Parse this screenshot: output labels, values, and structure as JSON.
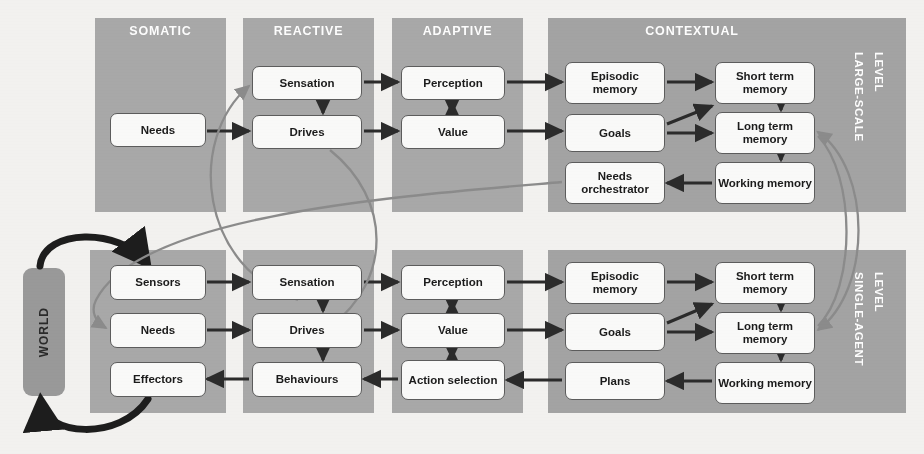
{
  "diagram": {
    "world_label": "WORLD",
    "colors": {
      "panel_gray": "#a9a9a9",
      "node_fill": "#fbfbfa",
      "node_stroke": "#5d5d5d",
      "arrow_dark": "#2b2b2b",
      "arrow_gray": "#8c8c8c",
      "title_text": "#ffffff",
      "background": "#f4f3f1"
    },
    "levels": [
      {
        "id": "large-scale",
        "label": "LARGE-SCALE\nLEVEL",
        "line1": "LARGE-SCALE",
        "line2": "LEVEL"
      },
      {
        "id": "single-agent",
        "label": "SINGLE-AGENT\nLEVEL",
        "line1": "SINGLE-AGENT",
        "line2": "LEVEL"
      }
    ],
    "columns": [
      {
        "id": "somatic",
        "title": "SOMATIC"
      },
      {
        "id": "reactive",
        "title": "REACTIVE"
      },
      {
        "id": "adaptive",
        "title": "ADAPTIVE"
      },
      {
        "id": "contextual",
        "title": "CONTEXTUAL"
      }
    ],
    "top_level_nodes": {
      "somatic": [
        "Needs"
      ],
      "reactive": [
        "Sensation",
        "Drives"
      ],
      "adaptive": [
        "Perception",
        "Value"
      ],
      "contextual_left": [
        "Episodic memory",
        "Goals",
        "Needs orchestrator"
      ],
      "contextual_right": [
        "Short term memory",
        "Long term memory",
        "Working memory"
      ]
    },
    "bottom_level_nodes": {
      "somatic": [
        "Sensors",
        "Needs",
        "Effectors"
      ],
      "reactive": [
        "Sensation",
        "Drives",
        "Behaviours"
      ],
      "adaptive": [
        "Perception",
        "Value",
        "Action selection"
      ],
      "contextual_left": [
        "Episodic memory",
        "Goals",
        "Plans"
      ],
      "contextual_right": [
        "Short term memory",
        "Long term memory",
        "Working memory"
      ]
    },
    "nodes": [
      {
        "id": "t-needs",
        "text": "Needs",
        "x": 110,
        "y": 113,
        "w": 96,
        "h": 34,
        "level": "top"
      },
      {
        "id": "t-sensation",
        "text": "Sensation",
        "x": 252,
        "y": 66,
        "w": 110,
        "h": 34,
        "level": "top"
      },
      {
        "id": "t-drives",
        "text": "Drives",
        "x": 252,
        "y": 115,
        "w": 110,
        "h": 34,
        "level": "top"
      },
      {
        "id": "t-perception",
        "text": "Perception",
        "x": 401,
        "y": 66,
        "w": 104,
        "h": 34,
        "level": "top"
      },
      {
        "id": "t-value",
        "text": "Value",
        "x": 401,
        "y": 115,
        "w": 104,
        "h": 34,
        "level": "top"
      },
      {
        "id": "t-episodic",
        "text": "Episodic memory",
        "x": 565,
        "y": 62,
        "w": 100,
        "h": 42,
        "level": "top"
      },
      {
        "id": "t-goals",
        "text": "Goals",
        "x": 565,
        "y": 114,
        "w": 100,
        "h": 38,
        "level": "top"
      },
      {
        "id": "t-needsorch",
        "text": "Needs orchestrator",
        "x": 565,
        "y": 162,
        "w": 100,
        "h": 42,
        "level": "top"
      },
      {
        "id": "t-short",
        "text": "Short term memory",
        "x": 715,
        "y": 62,
        "w": 100,
        "h": 42,
        "level": "top"
      },
      {
        "id": "t-long",
        "text": "Long term memory",
        "x": 715,
        "y": 112,
        "w": 100,
        "h": 42,
        "level": "top"
      },
      {
        "id": "t-working",
        "text": "Working memory",
        "x": 715,
        "y": 162,
        "w": 100,
        "h": 42,
        "level": "top"
      },
      {
        "id": "b-sensors",
        "text": "Sensors",
        "x": 110,
        "y": 265,
        "w": 96,
        "h": 35,
        "level": "bottom"
      },
      {
        "id": "b-needs",
        "text": "Needs",
        "x": 110,
        "y": 313,
        "w": 96,
        "h": 35,
        "level": "bottom"
      },
      {
        "id": "b-effectors",
        "text": "Effectors",
        "x": 110,
        "y": 362,
        "w": 96,
        "h": 35,
        "level": "bottom"
      },
      {
        "id": "b-sensation",
        "text": "Sensation",
        "x": 252,
        "y": 265,
        "w": 110,
        "h": 35,
        "level": "bottom"
      },
      {
        "id": "b-drives",
        "text": "Drives",
        "x": 252,
        "y": 313,
        "w": 110,
        "h": 35,
        "level": "bottom"
      },
      {
        "id": "b-behaviours",
        "text": "Behaviours",
        "x": 252,
        "y": 362,
        "w": 110,
        "h": 35,
        "level": "bottom"
      },
      {
        "id": "b-perception",
        "text": "Perception",
        "x": 401,
        "y": 265,
        "w": 104,
        "h": 35,
        "level": "bottom"
      },
      {
        "id": "b-value",
        "text": "Value",
        "x": 401,
        "y": 313,
        "w": 104,
        "h": 35,
        "level": "bottom"
      },
      {
        "id": "b-action",
        "text": "Action selection",
        "x": 401,
        "y": 360,
        "w": 104,
        "h": 40,
        "level": "bottom"
      },
      {
        "id": "b-episodic",
        "text": "Episodic memory",
        "x": 565,
        "y": 262,
        "w": 100,
        "h": 42,
        "level": "bottom"
      },
      {
        "id": "b-goals",
        "text": "Goals",
        "x": 565,
        "y": 313,
        "w": 100,
        "h": 38,
        "level": "bottom"
      },
      {
        "id": "b-plans",
        "text": "Plans",
        "x": 565,
        "y": 362,
        "w": 100,
        "h": 38,
        "level": "bottom"
      },
      {
        "id": "b-short",
        "text": "Short term memory",
        "x": 715,
        "y": 262,
        "w": 100,
        "h": 42,
        "level": "bottom"
      },
      {
        "id": "b-long",
        "text": "Long term memory",
        "x": 715,
        "y": 312,
        "w": 100,
        "h": 42,
        "level": "bottom"
      },
      {
        "id": "b-working",
        "text": "Working memory",
        "x": 715,
        "y": 362,
        "w": 100,
        "h": 42,
        "level": "bottom"
      }
    ],
    "edges": [
      {
        "from": "t-needs",
        "to": "t-drives",
        "style": "dark"
      },
      {
        "from": "t-sensation",
        "to": "t-drives",
        "style": "dark"
      },
      {
        "from": "t-sensation",
        "to": "t-perception",
        "style": "dark"
      },
      {
        "from": "t-drives",
        "to": "t-value",
        "style": "dark"
      },
      {
        "from": "t-perception",
        "to": "t-value",
        "style": "dark-bidirectional"
      },
      {
        "from": "t-perception",
        "to": "t-episodic",
        "style": "dark"
      },
      {
        "from": "t-value",
        "to": "t-goals",
        "style": "dark"
      },
      {
        "from": "t-episodic",
        "to": "t-short",
        "style": "dark"
      },
      {
        "from": "t-goals",
        "to": "t-short",
        "style": "dark"
      },
      {
        "from": "t-goals",
        "to": "t-long",
        "style": "dark"
      },
      {
        "from": "t-short",
        "to": "t-long",
        "style": "dark"
      },
      {
        "from": "t-long",
        "to": "t-working",
        "style": "dark"
      },
      {
        "from": "t-working",
        "to": "t-needsorch",
        "style": "dark"
      },
      {
        "from": "b-sensors",
        "to": "b-sensation",
        "style": "dark"
      },
      {
        "from": "b-needs",
        "to": "b-drives",
        "style": "dark"
      },
      {
        "from": "b-behaviours",
        "to": "b-effectors",
        "style": "dark"
      },
      {
        "from": "b-sensation",
        "to": "b-perception",
        "style": "dark"
      },
      {
        "from": "b-sensation",
        "to": "b-drives",
        "style": "dark"
      },
      {
        "from": "b-drives",
        "to": "b-behaviours",
        "style": "dark"
      },
      {
        "from": "b-drives",
        "to": "b-value",
        "style": "dark"
      },
      {
        "from": "b-perception",
        "to": "b-value",
        "style": "dark-bidirectional"
      },
      {
        "from": "b-value",
        "to": "b-action",
        "style": "dark-bidirectional"
      },
      {
        "from": "b-action",
        "to": "b-behaviours",
        "style": "dark"
      },
      {
        "from": "b-perception",
        "to": "b-episodic",
        "style": "dark"
      },
      {
        "from": "b-value",
        "to": "b-goals",
        "style": "dark"
      },
      {
        "from": "b-plans",
        "to": "b-action",
        "style": "dark"
      },
      {
        "from": "b-episodic",
        "to": "b-short",
        "style": "dark"
      },
      {
        "from": "b-goals",
        "to": "b-short",
        "style": "dark"
      },
      {
        "from": "b-goals",
        "to": "b-long",
        "style": "dark"
      },
      {
        "from": "b-short",
        "to": "b-long",
        "style": "dark"
      },
      {
        "from": "b-long",
        "to": "b-working",
        "style": "dark"
      },
      {
        "from": "b-working",
        "to": "b-plans",
        "style": "dark"
      },
      {
        "from": "world",
        "to": "b-sensors",
        "style": "dark-thick-curve"
      },
      {
        "from": "b-effectors",
        "to": "world",
        "style": "dark-thick-curve"
      },
      {
        "from": "b-sensation",
        "to": "t-sensation",
        "style": "gray-curve"
      },
      {
        "from": "t-needsorch",
        "to": "b-needs",
        "style": "gray-curve"
      },
      {
        "from": "t-drives",
        "to": "b-drives",
        "style": "gray-curve"
      },
      {
        "from": "t-long",
        "to": "b-long",
        "style": "gray-curve-bidirectional"
      }
    ]
  }
}
